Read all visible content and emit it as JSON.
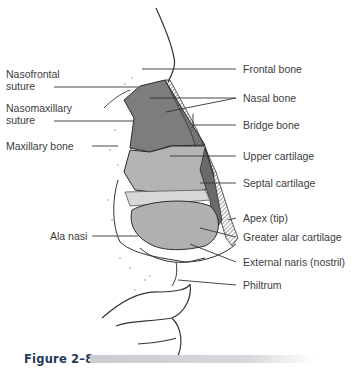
{
  "figure": {
    "caption": "Figure 2–8"
  },
  "labels": {
    "left": [
      {
        "id": "nasofrontal",
        "line1": "Nasofrontal",
        "line2": "suture"
      },
      {
        "id": "nasomaxillary",
        "line1": "Nasomaxillary",
        "line2": "suture"
      },
      {
        "id": "maxillary",
        "line1": "Maxillary bone"
      },
      {
        "id": "ala",
        "line1": "Ala nasi"
      }
    ],
    "right": [
      {
        "id": "frontal",
        "text": "Frontal bone"
      },
      {
        "id": "nasal",
        "text": "Nasal bone"
      },
      {
        "id": "bridge",
        "text": "Bridge bone"
      },
      {
        "id": "upper",
        "text": "Upper cartilage"
      },
      {
        "id": "septal",
        "text": "Septal cartilage"
      },
      {
        "id": "apex",
        "text": "Apex (tip)"
      },
      {
        "id": "alar",
        "text": "Greater alar cartilage"
      },
      {
        "id": "naris",
        "text": "External naris (nostril)"
      },
      {
        "id": "philtrum",
        "text": "Philtrum"
      }
    ]
  },
  "colors": {
    "bone_fill": "#7d7d7d",
    "cartilage_fill": "#b4b4b4",
    "line": "#2a2a2a",
    "caption": "#1f3a5a"
  }
}
